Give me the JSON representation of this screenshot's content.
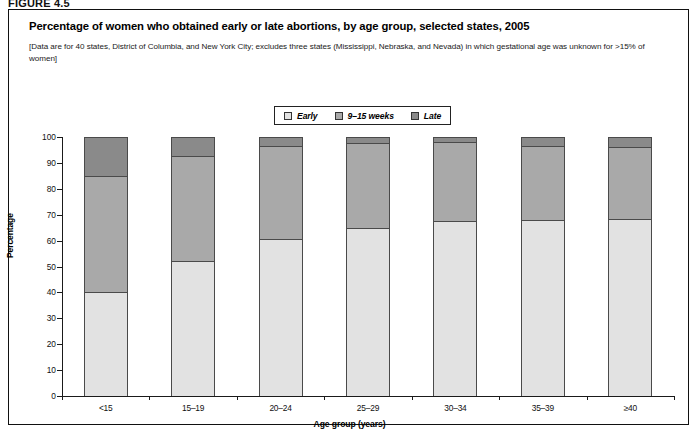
{
  "figure_number": "FIGURE 4.5",
  "title": "Percentage of women who obtained early or late abortions, by age group, selected states, 2005",
  "subtitle": "[Data are for 40 states, District of Columbia, and New York City; excludes three states (Mississippi, Nebraska, and Nevada) in which gestational age was unknown for >15% of women]",
  "colors": {
    "early": "#e2e2e2",
    "middle": "#a9a9a9",
    "late": "#8a8a8a",
    "outline": "#4a4a4a",
    "axis": "#1a1a1a"
  },
  "chart_data": {
    "type": "bar",
    "subtype": "stacked-100-percent",
    "title": "Percentage of women who obtained early or late abortions, by age group, selected states, 2005",
    "xlabel": "Age group (years)",
    "ylabel": "Percentage",
    "ylim": [
      0,
      100
    ],
    "yticks": [
      0,
      10,
      20,
      30,
      40,
      50,
      60,
      70,
      80,
      90,
      100
    ],
    "ytick_labels": [
      "0",
      "10",
      "20",
      "30",
      "40",
      "50",
      "60",
      "70",
      "80",
      "90",
      "100"
    ],
    "grid": false,
    "legend_position": "top-center",
    "categories": [
      "<15",
      "15–19",
      "20–24",
      "25–29",
      "30–34",
      "35–39",
      "≥40"
    ],
    "series": [
      {
        "name": "Early",
        "values": [
          40.0,
          52.0,
          60.5,
          65.0,
          67.5,
          68.0,
          68.5
        ]
      },
      {
        "name": "9–15 weeks",
        "values": [
          45.0,
          40.5,
          36.0,
          32.5,
          30.5,
          28.5,
          27.5
        ]
      },
      {
        "name": "Late",
        "values": [
          15.0,
          7.5,
          3.5,
          2.5,
          2.0,
          3.5,
          4.0
        ]
      }
    ],
    "cumulative_tops": [
      {
        "category": "<15",
        "early_top": 40.0,
        "middle_top": 85.0,
        "late_top": 100
      },
      {
        "category": "15–19",
        "early_top": 52.0,
        "middle_top": 92.5,
        "late_top": 100
      },
      {
        "category": "20–24",
        "early_top": 60.5,
        "middle_top": 96.5,
        "late_top": 100
      },
      {
        "category": "25–29",
        "early_top": 65.0,
        "middle_top": 97.5,
        "late_top": 100
      },
      {
        "category": "30–34",
        "early_top": 67.5,
        "middle_top": 98.0,
        "late_top": 100
      },
      {
        "category": "35–39",
        "early_top": 68.0,
        "middle_top": 96.5,
        "late_top": 100
      },
      {
        "category": "≥40",
        "early_top": 68.5,
        "middle_top": 96.0,
        "late_top": 100
      }
    ]
  },
  "legend": {
    "items": [
      {
        "label": "Early",
        "color": "#e2e2e2"
      },
      {
        "label": "9–15 weeks",
        "color": "#a9a9a9"
      },
      {
        "label": "Late",
        "color": "#8a8a8a"
      }
    ]
  }
}
